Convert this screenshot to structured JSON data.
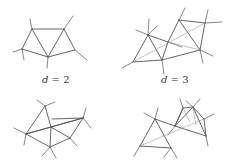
{
  "figure": {
    "stroke_color": "#555555",
    "dashed_color": "#888888",
    "panels": [
      {
        "id": "top-left",
        "label_var": "d",
        "label_eq": " = 2",
        "label_pos": [
          42,
          81
        ],
        "edges": [
          [
            32,
            29,
            64,
            29
          ],
          [
            32,
            29,
            22,
            49
          ],
          [
            32,
            29,
            48,
            57
          ],
          [
            64,
            29,
            48,
            57
          ],
          [
            64,
            29,
            75,
            50
          ],
          [
            22,
            49,
            48,
            57
          ],
          [
            48,
            57,
            75,
            50
          ]
        ],
        "half_edges": [
          [
            32,
            29,
            30,
            19
          ],
          [
            64,
            29,
            73,
            16
          ],
          [
            22,
            49,
            13,
            52
          ],
          [
            22,
            49,
            24,
            60
          ],
          [
            48,
            57,
            47,
            68
          ],
          [
            75,
            50,
            87,
            60
          ]
        ],
        "dashed": []
      },
      {
        "id": "top-right",
        "label_var": "d",
        "label_eq": " = 3",
        "label_pos": [
          161,
          81
        ],
        "edges": [
          [
            148,
            35,
            168,
            42
          ],
          [
            148,
            35,
            133,
            62
          ],
          [
            148,
            35,
            162,
            60
          ],
          [
            168,
            42,
            179,
            20
          ],
          [
            168,
            42,
            162,
            60
          ],
          [
            179,
            20,
            205,
            23
          ],
          [
            179,
            20,
            200,
            50
          ],
          [
            205,
            23,
            200,
            50
          ],
          [
            162,
            60,
            200,
            50
          ],
          [
            133,
            62,
            162,
            60
          ]
        ],
        "half_edges": [
          [
            148,
            35,
            149,
            19
          ],
          [
            148,
            35,
            157,
            26
          ],
          [
            148,
            35,
            136,
            30
          ],
          [
            133,
            62,
            122,
            68
          ],
          [
            162,
            60,
            164,
            74
          ],
          [
            179,
            20,
            185,
            8
          ],
          [
            205,
            23,
            208,
            10
          ],
          [
            205,
            23,
            222,
            22
          ],
          [
            200,
            50,
            203,
            63
          ],
          [
            200,
            50,
            213,
            56
          ],
          [
            168,
            42,
            182,
            47
          ]
        ],
        "dashed": [
          [
            133,
            62,
            205,
            23
          ],
          [
            168,
            42,
            200,
            50
          ]
        ]
      },
      {
        "id": "bottom-left",
        "label_var": "",
        "label_eq": "",
        "label_pos": [
          0,
          0
        ],
        "edges": [
          [
            45,
            106,
            26,
            134
          ],
          [
            45,
            106,
            51,
            127
          ],
          [
            26,
            134,
            51,
            127
          ],
          [
            26,
            134,
            50,
            147
          ],
          [
            51,
            127,
            83,
            118
          ],
          [
            51,
            127,
            50,
            147
          ],
          [
            51,
            127,
            70,
            138
          ],
          [
            50,
            147,
            70,
            138
          ],
          [
            70,
            138,
            83,
            118
          ],
          [
            26,
            134,
            83,
            118
          ],
          [
            52,
            119,
            83,
            118
          ]
        ],
        "half_edges": [
          [
            45,
            106,
            37,
            100
          ],
          [
            45,
            106,
            55,
            102
          ],
          [
            26,
            134,
            14,
            128
          ],
          [
            26,
            134,
            24,
            145
          ],
          [
            50,
            147,
            56,
            158
          ],
          [
            50,
            147,
            42,
            156
          ],
          [
            83,
            118,
            86,
            108
          ],
          [
            83,
            118,
            91,
            128
          ],
          [
            70,
            138,
            77,
            146
          ]
        ],
        "dashed": []
      },
      {
        "id": "bottom-right",
        "label_var": "",
        "label_eq": "",
        "label_pos": [
          0,
          0
        ],
        "edges": [
          [
            155,
            119,
            140,
            146
          ],
          [
            155,
            119,
            171,
            148
          ],
          [
            140,
            146,
            171,
            148
          ],
          [
            155,
            119,
            175,
            126
          ],
          [
            175,
            126,
            183,
            108
          ],
          [
            183,
            108,
            193,
            107
          ],
          [
            193,
            107,
            204,
            119
          ],
          [
            204,
            119,
            206,
            136
          ],
          [
            175,
            126,
            206,
            136
          ],
          [
            183,
            108,
            175,
            126
          ],
          [
            193,
            107,
            175,
            126
          ],
          [
            193,
            107,
            206,
            136
          ]
        ],
        "half_edges": [
          [
            155,
            119,
            158,
            108
          ],
          [
            155,
            119,
            144,
            113
          ],
          [
            140,
            146,
            134,
            156
          ],
          [
            171,
            148,
            177,
            158
          ],
          [
            171,
            148,
            164,
            157
          ],
          [
            183,
            108,
            180,
            99
          ],
          [
            193,
            107,
            200,
            99
          ],
          [
            193,
            107,
            186,
            101
          ],
          [
            204,
            119,
            214,
            114
          ],
          [
            206,
            136,
            208,
            146
          ],
          [
            175,
            126,
            168,
            135
          ]
        ],
        "dashed": [
          [
            140,
            146,
            204,
            119
          ],
          [
            193,
            107,
            196,
            125
          ],
          [
            183,
            108,
            190,
            122
          ]
        ]
      }
    ]
  }
}
